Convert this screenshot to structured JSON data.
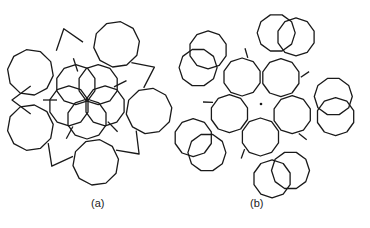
{
  "figure": {
    "panels": [
      {
        "id": "a",
        "label": "(a)",
        "description": "Decagon cluster with five outer decagons, five overlapping inner decagons forming a star around a central point, and star-shaped gaps between outer decagons",
        "outer_decagon_count": 5,
        "inner_overlapping_decagon_count": 5
      },
      {
        "id": "b",
        "label": "(b)",
        "description": "Decagon cluster with five inner decagons around a central dot, and five pairs of overlapping decagons on the outer ring",
        "inner_decagon_count": 5,
        "outer_overlapping_pair_count": 5,
        "has_center_dot": true
      }
    ],
    "line_color": "#1a1a1a",
    "background": "#ffffff"
  }
}
